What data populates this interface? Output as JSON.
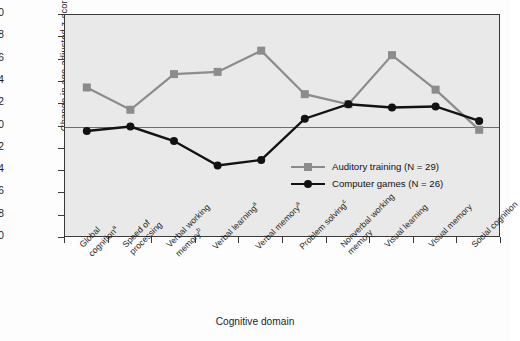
{
  "chart_data": {
    "type": "line",
    "title": "",
    "xlabel": "Cognitive domain",
    "ylabel": "Change in age-adjusted z-score",
    "ylim": [
      -1.0,
      1.0
    ],
    "ytick_labels": [
      "1.0",
      "0.8",
      "0.6",
      "0.4",
      "0.2",
      "0",
      "−0.2",
      "−0.4",
      "−0.6",
      "−0.8",
      "−1.0"
    ],
    "ytick_values": [
      1.0,
      0.8,
      0.6,
      0.4,
      0.2,
      0,
      -0.2,
      -0.4,
      -0.6,
      -0.8,
      -1.0
    ],
    "grid": false,
    "legend_position": "inside-right-middle",
    "categories": [
      "Global cognition",
      "Speed of processing",
      "Verbal working memory",
      "Verbal learning",
      "Verbal memory",
      "Problem solving",
      "Nonverbal working memory",
      "Visual learning",
      "Visual memory",
      "Social cognition"
    ],
    "category_lines": [
      [
        "Global",
        "cognition"
      ],
      [
        "Speed of",
        "processing"
      ],
      [
        "Verbal working",
        "memory"
      ],
      [
        "Verbal learning"
      ],
      [
        "Verbal memory"
      ],
      [
        "Problem solving"
      ],
      [
        "Nonverbal working",
        "memory"
      ],
      [
        "Visual learning"
      ],
      [
        "Visual memory"
      ],
      [
        "Social cognition"
      ]
    ],
    "category_superscripts": [
      "a",
      "",
      "b",
      "a",
      "a",
      "c",
      "",
      "",
      "",
      ""
    ],
    "series": [
      {
        "name": "Auditory training (N = 29)",
        "label": "Auditory training (N = 29)",
        "color": "#8c8c8c",
        "marker": "square",
        "values": [
          0.35,
          0.15,
          0.47,
          0.49,
          0.68,
          0.29,
          0.2,
          0.64,
          0.33,
          -0.03
        ]
      },
      {
        "name": "Computer games (N = 26)",
        "label": "Computer games (N = 26)",
        "color": "#121212",
        "marker": "circle",
        "values": [
          -0.04,
          0.0,
          -0.13,
          -0.35,
          -0.3,
          0.07,
          0.2,
          0.17,
          0.18,
          0.05
        ]
      }
    ]
  },
  "colors": {
    "plot_background": "#e9e9e9",
    "axis": "#3a3a3a",
    "zero_line": "#6d6d6d",
    "series_auditory": "#8c8c8c",
    "series_games": "#121212"
  }
}
